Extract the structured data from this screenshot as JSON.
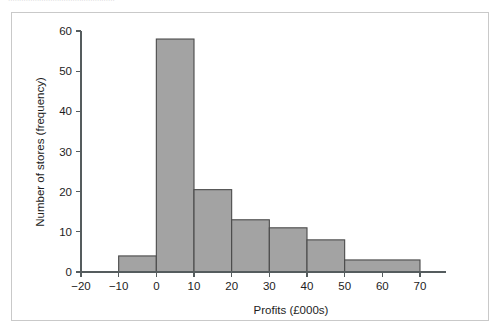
{
  "figure": {
    "caption_remnant": "................................................",
    "frame_color": "#c9c9c9",
    "background": "#ffffff"
  },
  "chart_data": {
    "type": "bar",
    "subtype": "histogram",
    "title": "",
    "xlabel": "Profits (£000s)",
    "ylabel": "Number of stores (frequency)",
    "xlim": [
      -20,
      70
    ],
    "ylim": [
      0,
      60
    ],
    "xticks": [
      -20,
      -10,
      0,
      10,
      20,
      30,
      40,
      50,
      60,
      70
    ],
    "xticklabels": [
      "−20",
      "−10",
      "0",
      "10",
      "20",
      "30",
      "40",
      "50",
      "60",
      "70"
    ],
    "yticks": [
      0,
      10,
      20,
      30,
      40,
      50,
      60
    ],
    "yticklabels": [
      "0",
      "10",
      "20",
      "30",
      "40",
      "50",
      "60"
    ],
    "grid": false,
    "legend": false,
    "bar_fill": "#a3a3a3",
    "bar_edge": "#4a4a4a",
    "bins": [
      {
        "label": "−10 to 0",
        "x0": -10,
        "x1": 0,
        "value": 4
      },
      {
        "label": "0 to 10",
        "x0": 0,
        "x1": 10,
        "value": 58
      },
      {
        "label": "10 to 20",
        "x0": 10,
        "x1": 20,
        "value": 20.5
      },
      {
        "label": "20 to 30",
        "x0": 20,
        "x1": 30,
        "value": 13
      },
      {
        "label": "30 to 40",
        "x0": 30,
        "x1": 40,
        "value": 11
      },
      {
        "label": "40 to 50",
        "x0": 40,
        "x1": 50,
        "value": 8
      },
      {
        "label": "50 to 70",
        "x0": 50,
        "x1": 70,
        "value": 3
      }
    ]
  }
}
